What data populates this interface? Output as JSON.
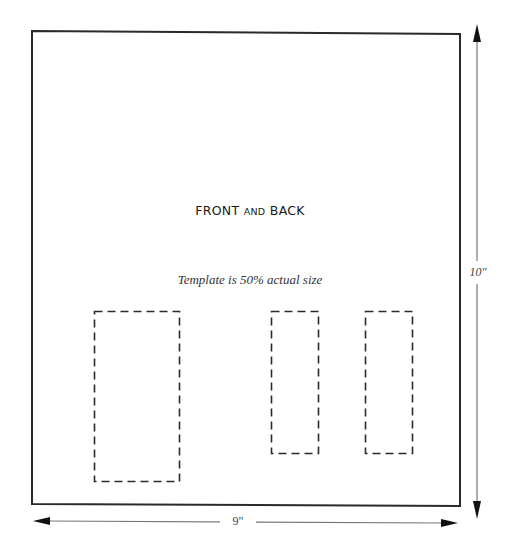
{
  "diagram": {
    "title_main": "FRONT",
    "title_connector": "AND",
    "title_end": "BACK",
    "note": "Template is 50% actual size",
    "dimensions": {
      "height_label": "10\"",
      "width_label": "9\""
    },
    "shapes": {
      "outer_rectangle": {
        "style": "solid"
      },
      "cutouts": [
        {
          "id": "cutout-large",
          "style": "dashed"
        },
        {
          "id": "cutout-middle",
          "style": "dashed"
        },
        {
          "id": "cutout-right",
          "style": "dashed"
        }
      ]
    },
    "colors": {
      "outline": "#2a2a2a",
      "dimension_line": "#777777",
      "background": "#ffffff"
    }
  }
}
